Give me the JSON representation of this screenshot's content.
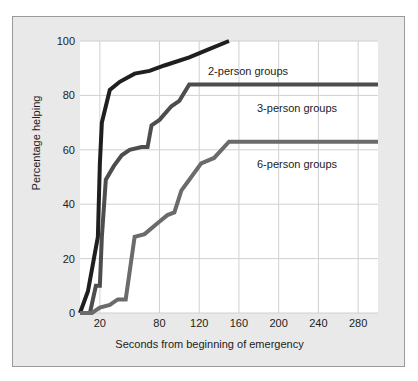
{
  "figure": {
    "background_color": "#e9e9e9",
    "plot_background_color": "#ffffff",
    "border_color": "#9a9a9a",
    "gridline_color": "#d0d0d0"
  },
  "chart_data": {
    "type": "line",
    "title": "",
    "xlabel": "Seconds from beginning of emergency",
    "ylabel": "Percentage helping",
    "xlim": [
      0,
      300
    ],
    "ylim": [
      0,
      100
    ],
    "grid": true,
    "legend_position": "inline-annotations",
    "xticks": [
      20,
      80,
      120,
      160,
      200,
      240,
      280
    ],
    "xtick_labels": [
      "20",
      "80",
      "120",
      "160",
      "200",
      "240",
      "280"
    ],
    "yticks": [
      0,
      20,
      40,
      60,
      80,
      100
    ],
    "ytick_labels": [
      "0",
      "20",
      "40",
      "60",
      "80",
      "100"
    ],
    "series": [
      {
        "name": "2-person groups",
        "color": "#1f1f1f",
        "label_x": 160,
        "label_y": 91,
        "x": [
          0,
          8,
          14,
          18,
          20,
          22,
          30,
          40,
          55,
          70,
          85,
          110,
          130,
          150
        ],
        "y": [
          0,
          8,
          20,
          28,
          55,
          70,
          82,
          85,
          88,
          89,
          91,
          94,
          97,
          100
        ]
      },
      {
        "name": "3-person groups",
        "color": "#4d4d4d",
        "label_x": 178,
        "label_y": 76,
        "x": [
          0,
          10,
          16,
          20,
          22,
          26,
          34,
          42,
          50,
          62,
          68,
          72,
          80,
          92,
          100,
          110,
          300
        ],
        "y": [
          0,
          0,
          10,
          10,
          28,
          49,
          54,
          58,
          60,
          61,
          61,
          69,
          71,
          76,
          78,
          84,
          84
        ]
      },
      {
        "name": "6-person groups",
        "color": "#6b6b6b",
        "label_x": 178,
        "label_y": 55,
        "x": [
          0,
          12,
          20,
          30,
          38,
          46,
          55,
          65,
          78,
          88,
          95,
          102,
          110,
          122,
          135,
          150,
          300
        ],
        "y": [
          0,
          0,
          2,
          3,
          5,
          5,
          28,
          29,
          33,
          36,
          37,
          45,
          49,
          55,
          57,
          63,
          63
        ]
      }
    ]
  }
}
